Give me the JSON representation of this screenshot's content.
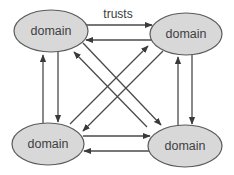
{
  "diagram": {
    "edge_label": "trusts",
    "colors": {
      "node_fill": "#d8d8d8",
      "node_stroke": "#5a5a5a",
      "edge": "#4a4a4a",
      "text": "#3f3f3f"
    },
    "nodes": [
      {
        "id": "top-left",
        "label": "domain"
      },
      {
        "id": "top-right",
        "label": "domain"
      },
      {
        "id": "bottom-left",
        "label": "domain"
      },
      {
        "id": "bottom-right",
        "label": "domain"
      }
    ],
    "edges": [
      {
        "from": "top-left",
        "to": "top-right",
        "label": "trusts"
      },
      {
        "from": "top-right",
        "to": "top-left"
      },
      {
        "from": "bottom-left",
        "to": "bottom-right"
      },
      {
        "from": "bottom-right",
        "to": "bottom-left"
      },
      {
        "from": "bottom-left",
        "to": "top-left"
      },
      {
        "from": "top-left",
        "to": "bottom-left"
      },
      {
        "from": "bottom-right",
        "to": "top-right"
      },
      {
        "from": "top-right",
        "to": "bottom-right"
      },
      {
        "from": "bottom-right",
        "to": "top-left"
      },
      {
        "from": "top-left",
        "to": "bottom-right"
      },
      {
        "from": "bottom-left",
        "to": "top-right"
      },
      {
        "from": "top-right",
        "to": "bottom-left"
      }
    ]
  }
}
